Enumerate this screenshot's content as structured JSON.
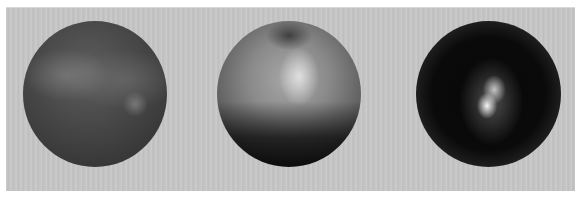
{
  "image": {
    "description": "Three rendered shaded spheres on a gray striated background",
    "background_color": "#c4c4c4",
    "spheres": [
      {
        "label": "sphere-1",
        "shading": "dark matte with faint diffuse highlights",
        "base_color": "#474747"
      },
      {
        "label": "sphere-2",
        "shading": "glossy gray with top-center specular highlight and dark lower half",
        "base_color": "#8a8a8a"
      },
      {
        "label": "sphere-3",
        "shading": "near-black with bright central specular spot and rim light",
        "base_color": "#0a0a0a"
      }
    ]
  }
}
